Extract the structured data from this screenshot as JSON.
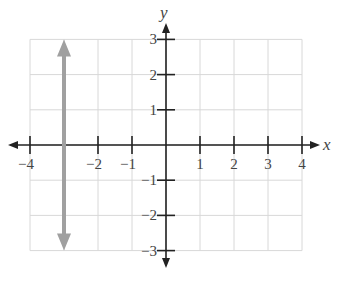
{
  "chart_data": {
    "type": "line",
    "title": "",
    "xlabel": "x",
    "ylabel": "y",
    "xlim": [
      -4,
      4
    ],
    "ylim": [
      -3,
      3
    ],
    "grid": true,
    "x_ticks": [
      -4,
      -3,
      -2,
      -1,
      1,
      2,
      3,
      4
    ],
    "x_tick_labels": [
      "−4",
      "",
      "−2",
      "−1",
      "1",
      "2",
      "3",
      "4"
    ],
    "y_ticks": [
      -3,
      -2,
      -1,
      1,
      2,
      3
    ],
    "y_tick_labels": [
      "−3",
      "−2",
      "−1",
      "1",
      "2",
      "3"
    ],
    "series": [
      {
        "name": "x = -3",
        "equation": "x = -3",
        "points": [
          {
            "x": -3,
            "y": -3
          },
          {
            "x": -3,
            "y": 3
          }
        ],
        "arrows_both_ends": true,
        "color": "#a0a0a0"
      }
    ],
    "legend": null
  },
  "colors": {
    "axis": "#222222",
    "grid": "#d8d8d8",
    "line": "#a0a0a0",
    "text": "#444444"
  }
}
